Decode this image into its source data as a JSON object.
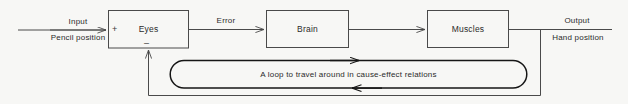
{
  "diagram": {
    "type": "block-diagram",
    "background_color": "#f7f7f5",
    "line_color": "#4a4a4a",
    "loop_color": "#161616",
    "text_color": "#2b2b2b",
    "blocks": [
      {
        "id": "eyes",
        "label": "Eyes"
      },
      {
        "id": "brain",
        "label": "Brain"
      },
      {
        "id": "muscles",
        "label": "Muscles"
      }
    ],
    "signs": {
      "plus": "+",
      "minus": "–"
    },
    "edge_labels": {
      "input_top": "Input",
      "input_bottom": "Pencil position",
      "error": "Error",
      "output_top": "Output",
      "output_bottom": "Hand position"
    },
    "loop": {
      "caption": "A loop to travel around in cause-effect relations"
    }
  }
}
